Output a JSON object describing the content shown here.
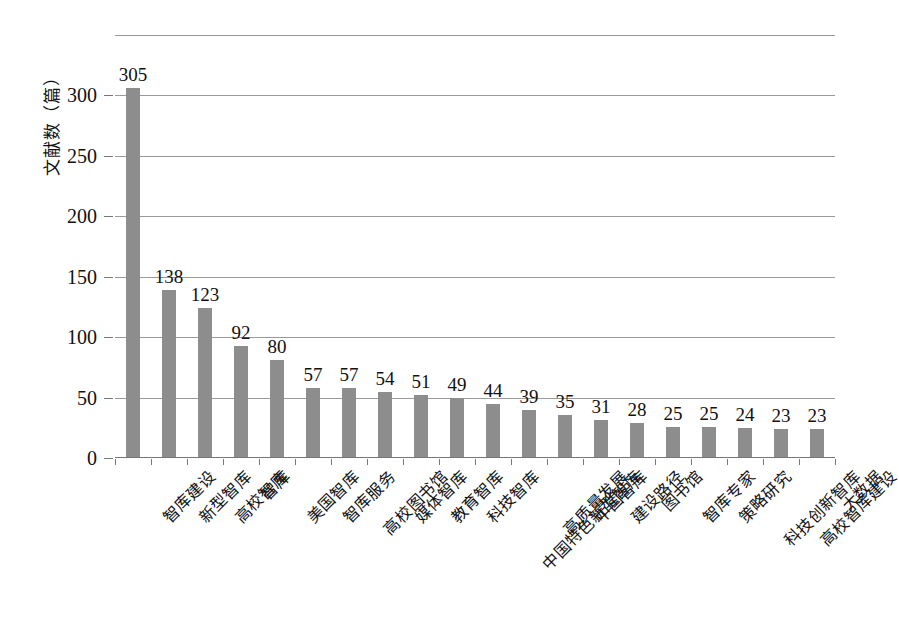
{
  "chart_data": {
    "type": "bar",
    "title": "",
    "xlabel": "",
    "ylabel": "文献数（篇）",
    "ylim": [
      0,
      350
    ],
    "yticks": [
      0,
      50,
      100,
      150,
      200,
      250,
      300
    ],
    "ytick_labels": [
      "0",
      "50",
      "100",
      "150",
      "200",
      "250",
      "300"
    ],
    "grid": true,
    "legend": "none",
    "categories": [
      "智库建设",
      "新型智库",
      "高校智库",
      "智库",
      "美国智库",
      "智库服务",
      "高校图书馆",
      "媒体智库",
      "教育智库",
      "科技智库",
      "中国特色新型智库",
      "高质量发展",
      "中国智库",
      "建设路径",
      "图书馆",
      "智库专家",
      "策略研究",
      "科技创新智库",
      "高校智库建设",
      "大数据"
    ],
    "values": [
      305,
      138,
      123,
      92,
      80,
      57,
      57,
      54,
      51,
      49,
      44,
      39,
      35,
      31,
      28,
      25,
      25,
      24,
      23,
      23
    ],
    "value_labels": [
      "305",
      "138",
      "123",
      "92",
      "80",
      "57",
      "57",
      "54",
      "51",
      "49",
      "44",
      "39",
      "35",
      "31",
      "28",
      "25",
      "25",
      "24",
      "23",
      "23"
    ],
    "bar_color": "#8d8d8d",
    "grid_color": "#9a9a9a",
    "axis_color": "#777777",
    "text_color": "#111111"
  }
}
